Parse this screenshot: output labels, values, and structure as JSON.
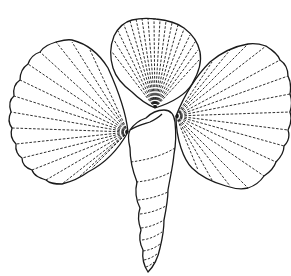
{
  "illustration": {
    "subject": "Line drawing of three scallop shells arranged around a tower snail shell",
    "style": "black ink outline with dashed radial ribs on white background",
    "colors": {
      "background": "#ffffff",
      "ink": "#1a1a1a"
    },
    "elements": [
      {
        "name": "left-scallop-shell",
        "type": "bivalve shell",
        "ribs": 16
      },
      {
        "name": "top-scallop-shell",
        "type": "bivalve shell",
        "ribs": 18
      },
      {
        "name": "right-scallop-shell",
        "type": "bivalve shell",
        "ribs": 16
      },
      {
        "name": "tower-snail-shell",
        "type": "gastropod shell",
        "whorls": 9
      }
    ]
  }
}
